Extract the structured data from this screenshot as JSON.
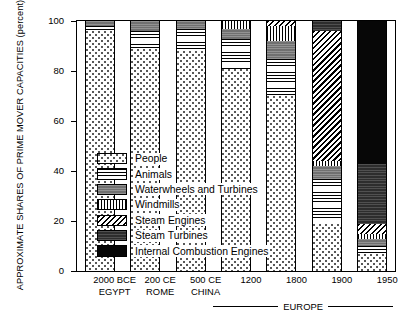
{
  "chart_data": {
    "type": "bar",
    "subtype": "stacked-bar-100-percent",
    "title": "",
    "xlabel": "",
    "ylabel": "APPROXIMATE SHARES OF PRIME MOVER CAPACITIES (percent)",
    "ylim": [
      0,
      100
    ],
    "yticks": [
      0,
      20,
      40,
      60,
      80,
      100
    ],
    "ytick_labels": [
      "0",
      "20",
      "40",
      "60",
      "80",
      "100"
    ],
    "grid": false,
    "legend_position": "center-left-inside",
    "categories": [
      "2000 BCE",
      "200 CE",
      "500 CE",
      "1200",
      "1800",
      "1900",
      "1950"
    ],
    "category_sublabels": [
      "EGYPT",
      "ROME",
      "CHINA",
      "",
      "",
      "",
      ""
    ],
    "group_annotation": {
      "label": "EUROPE",
      "spans_categories": [
        "1200",
        "1800",
        "1900",
        "1950"
      ]
    },
    "series": [
      {
        "name": "People",
        "pattern": "sparse-dots",
        "values": [
          96,
          89,
          88,
          81,
          70,
          19,
          7
        ]
      },
      {
        "name": "Animals",
        "pattern": "horizontal-lines",
        "values": [
          2,
          7,
          9,
          12,
          15,
          18,
          3
        ]
      },
      {
        "name": "Waterwheels and Turbines",
        "pattern": "solid-gray",
        "values": [
          2,
          4,
          3,
          4,
          7,
          5,
          3
        ]
      },
      {
        "name": "Windmills",
        "pattern": "vertical-lines",
        "values": [
          0,
          0,
          0,
          3,
          6,
          2,
          2
        ]
      },
      {
        "name": "Steam Engines",
        "pattern": "diagonal-hatch",
        "values": [
          0,
          0,
          0,
          0,
          2,
          52,
          4
        ]
      },
      {
        "name": "Steam Turbines",
        "pattern": "dark-gray",
        "values": [
          0,
          0,
          0,
          0,
          0,
          4,
          24
        ]
      },
      {
        "name": "Internal Combustion Engines",
        "pattern": "solid-black",
        "values": [
          0,
          0,
          0,
          0,
          0,
          0,
          57
        ]
      }
    ]
  },
  "legend": {
    "entries": [
      {
        "label": "People",
        "pattern_class": "p-people"
      },
      {
        "label": "Animals",
        "pattern_class": "p-animals"
      },
      {
        "label": "Waterwheels and Turbines",
        "pattern_class": "p-water"
      },
      {
        "label": "Windmills",
        "pattern_class": "p-wind"
      },
      {
        "label": "Steam Engines",
        "pattern_class": "p-steameng"
      },
      {
        "label": "Steam Turbines",
        "pattern_class": "p-steamturb"
      },
      {
        "label": "Internal Combustion Engines",
        "pattern_class": "p-ice"
      }
    ]
  },
  "colors": {
    "axis": "#000000",
    "background": "#ffffff",
    "waterwheels": "#7d7d7d",
    "steam_turbines": "#3c3c3c",
    "internal_combustion": "#070707"
  }
}
